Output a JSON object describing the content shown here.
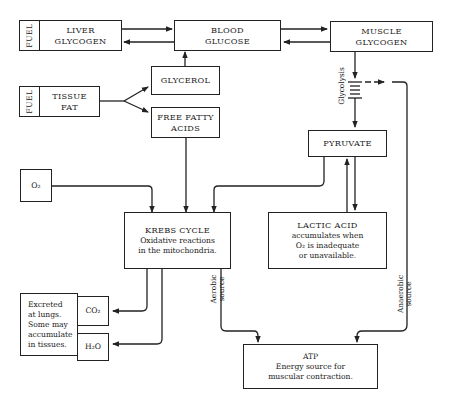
{
  "nodes": {
    "liver_glycogen": {
      "tag": "FUEL",
      "line1": "LIVER",
      "line2": "GLYCOGEN"
    },
    "blood_glucose": {
      "line1": "BLOOD",
      "line2": "GLUCOSE"
    },
    "muscle_glycogen": {
      "line1": "MUSCLE",
      "line2": "GLYCOGEN"
    },
    "tissue_fat": {
      "tag": "FUEL",
      "line1": "TISSUE",
      "line2": "FAT"
    },
    "glycerol": {
      "line1": "GLYCEROL"
    },
    "free_fatty_acids": {
      "line1": "FREE FATTY",
      "line2": "ACIDS"
    },
    "glycolysis": {
      "label": "Glycolysis"
    },
    "pyruvate": {
      "line1": "PYRUVATE"
    },
    "oxygen": {
      "label": "O₂"
    },
    "krebs_cycle": {
      "title": "KREBS CYCLE",
      "line1": "Oxidative reactions",
      "line2": "in the mitochondria."
    },
    "lactic_acid": {
      "title": "LACTIC ACID",
      "line1": "accumulates when",
      "line2": "O₂ is inadequate",
      "line3": "or unavailable."
    },
    "excreted": {
      "line1": "Excreted",
      "line2": "at lungs.",
      "line3": "Some may",
      "line4": "accumulate",
      "line5": "in tissues."
    },
    "co2": {
      "label": "CO₂"
    },
    "h2o": {
      "label": "H₂O"
    },
    "atp": {
      "title": "ATP",
      "line1": "Energy source for",
      "line2": "muscular contraction."
    }
  },
  "edge_labels": {
    "aerobic": {
      "line1": "Aerobic",
      "line2": "source"
    },
    "anaerobic": {
      "line1": "Anaerobic",
      "line2": "source"
    }
  },
  "colors": {
    "line": "#222222",
    "background": "#ffffff"
  }
}
